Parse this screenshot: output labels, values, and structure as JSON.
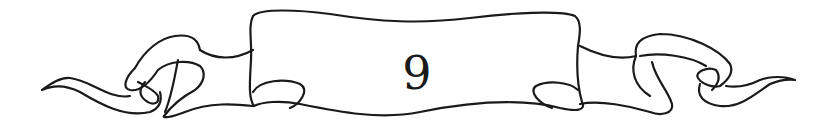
{
  "banner": {
    "number": "9",
    "stroke_color": "#1a1a1a",
    "background": "#ffffff"
  }
}
